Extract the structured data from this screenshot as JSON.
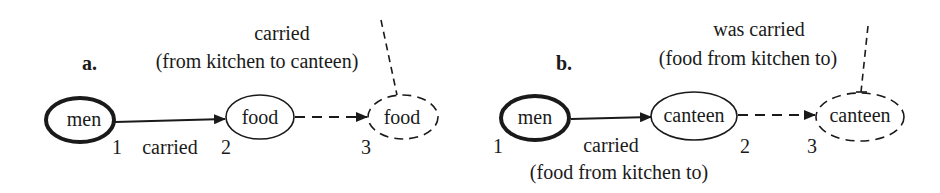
{
  "panels": [
    {
      "label": "a.",
      "top_annotation": {
        "line1": "carried",
        "line2": "(from kitchen to canteen)"
      },
      "nodes": [
        {
          "text": "men",
          "number": "1",
          "style": "bold"
        },
        {
          "text": "food",
          "number": "2",
          "style": "solid"
        },
        {
          "text": "food",
          "number": "3",
          "style": "dashed"
        }
      ],
      "edge_label": "carried"
    },
    {
      "label": "b.",
      "top_annotation": {
        "line1": "was carried",
        "line2": "(food from kitchen to)"
      },
      "nodes": [
        {
          "text": "men",
          "number": "1",
          "style": "bold"
        },
        {
          "text": "canteen",
          "number": "2",
          "style": "solid"
        },
        {
          "text": "canteen",
          "number": "3",
          "style": "dashed"
        }
      ],
      "edge_label": {
        "line1": "carried",
        "line2": "(food from kitchen to)"
      }
    }
  ],
  "colors": {
    "ink": "#1a1a1a",
    "background": "#ffffff"
  }
}
